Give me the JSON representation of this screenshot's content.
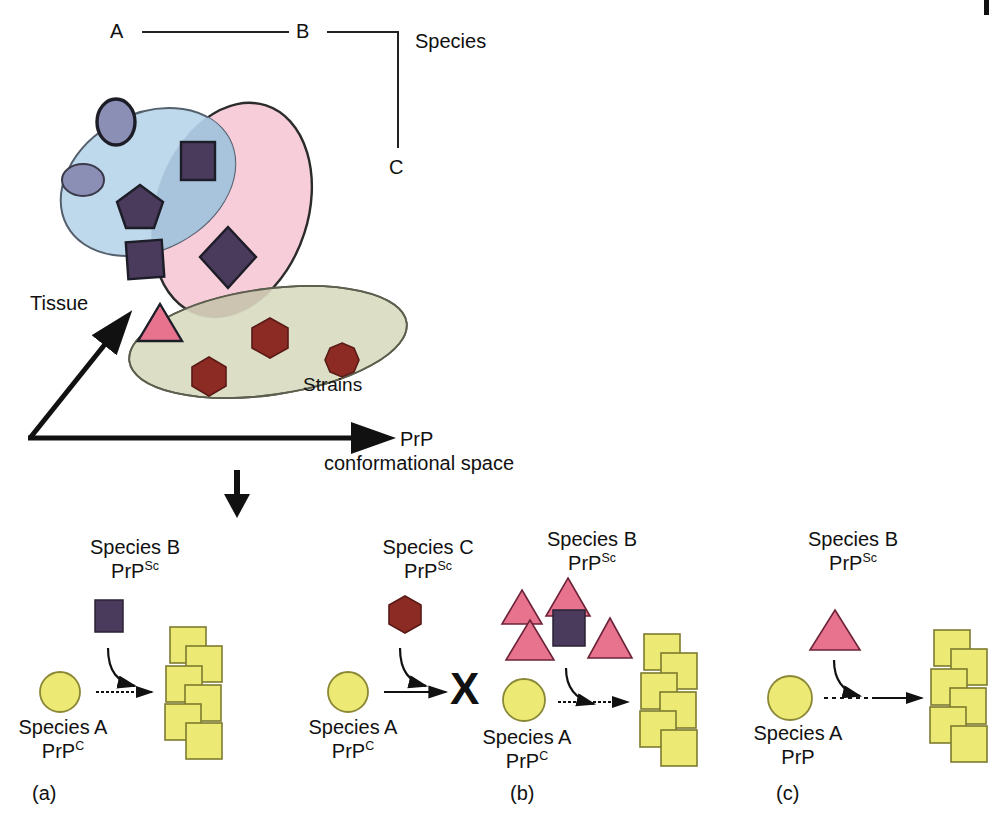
{
  "figure": {
    "domain": "scientific-diagram",
    "background": "#ffffff"
  },
  "top_diagram": {
    "species_axis": {
      "label": "Species",
      "nodes": [
        {
          "id": "A",
          "label": "A"
        },
        {
          "id": "B",
          "label": "B"
        },
        {
          "id": "C",
          "label": "C"
        }
      ]
    },
    "axes": {
      "vertical_label": "Tissue",
      "horizontal_label_line1": "PrP",
      "horizontal_label_line2": "conformational space"
    },
    "regions": [
      {
        "name": "blue-ellipse",
        "color": "#b9d6ea",
        "stroke": "#4a5568"
      },
      {
        "name": "pink-ellipse",
        "color": "#f6cdd9",
        "stroke": "#2b2b2b"
      },
      {
        "name": "olive-ellipse",
        "color": "#d9dcc2",
        "stroke": "#5d5f4e"
      }
    ],
    "strains_label": "Strains",
    "shape_colors": {
      "purple": "#4a3a5c",
      "slate": "#8b8fb5",
      "pink": "#e8738f",
      "darkred": "#8c2b24",
      "yellow": "#ecea74"
    },
    "conformer_shapes": [
      {
        "shape": "ellipse",
        "region": "blue"
      },
      {
        "shape": "ellipse",
        "region": "blue"
      },
      {
        "shape": "square",
        "region": "blue-pink-overlap"
      },
      {
        "shape": "pentagon",
        "region": "blue-pink-overlap"
      },
      {
        "shape": "square",
        "region": "blue-pink-overlap"
      },
      {
        "shape": "diamond",
        "region": "blue-pink-overlap"
      },
      {
        "shape": "triangle",
        "region": "pink-olive-overlap"
      },
      {
        "shape": "hexagon",
        "region": "olive"
      },
      {
        "shape": "hexagon",
        "region": "olive"
      },
      {
        "shape": "octagon",
        "region": "olive"
      }
    ]
  },
  "panels": [
    {
      "id": "a",
      "panel_label": "(a)",
      "sub_panels": [
        {
          "donor_line1": "Species B",
          "donor_line2_base": "PrP",
          "donor_line2_sup": "Sc",
          "donor_shape": "square",
          "donor_color": "#4a3a5c",
          "host_line1": "Species A",
          "host_line2_base": "PrP",
          "host_line2_sup": "C",
          "host_shape": "circle",
          "host_color": "#ecea74",
          "arrow_style": "dotted",
          "outcome": "aggregate",
          "outcome_symbol": ""
        },
        {
          "donor_line1": "Species C",
          "donor_line2_base": "PrP",
          "donor_line2_sup": "Sc",
          "donor_shape": "hexagon",
          "donor_color": "#8c2b24",
          "host_line1": "Species A",
          "host_line2_base": "PrP",
          "host_line2_sup": "C",
          "host_shape": "circle",
          "host_color": "#ecea74",
          "arrow_style": "solid",
          "outcome": "blocked",
          "outcome_symbol": "X"
        }
      ]
    },
    {
      "id": "b",
      "panel_label": "(b)",
      "sub_panels": [
        {
          "donor_line1": "Species B",
          "donor_line2_base": "PrP",
          "donor_line2_sup": "Sc",
          "donor_shape": "triangle-cluster",
          "donor_color": "#e8738f",
          "minor_shape": "square",
          "minor_color": "#4a3a5c",
          "triangle_count": 4,
          "host_line1": "Species A",
          "host_line2_base": "PrP",
          "host_line2_sup": "C",
          "host_shape": "circle",
          "host_color": "#ecea74",
          "arrow_style": "dotted",
          "outcome": "aggregate",
          "outcome_symbol": ""
        }
      ]
    },
    {
      "id": "c",
      "panel_label": "(c)",
      "sub_panels": [
        {
          "donor_line1": "Species B",
          "donor_line2_base": "PrP",
          "donor_line2_sup": "Sc",
          "donor_shape": "triangle",
          "donor_color": "#e8738f",
          "host_line1": "Species A",
          "host_line2_base": "PrP",
          "host_line2_sup": "",
          "host_shape": "circle",
          "host_color": "#ecea74",
          "arrow_style": "dashed",
          "outcome": "aggregate",
          "outcome_symbol": ""
        }
      ]
    }
  ]
}
